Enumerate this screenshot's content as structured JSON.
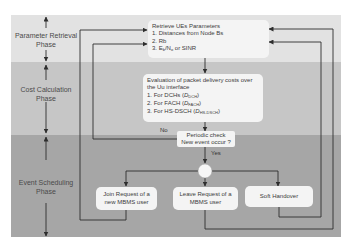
{
  "colors": {
    "band_retrieval": "#e2e2e2",
    "band_cost": "#c6c6c6",
    "band_event": "#a6a6a6",
    "box_fill": "#f4f4f4",
    "line": "#2e2e2e"
  },
  "phases": [
    {
      "label_line1": "Parameter Retrieval",
      "label_line2": "Phase"
    },
    {
      "label_line1": "Cost Calculation",
      "label_line2": "Phase"
    },
    {
      "label_line1": "Event Scheduling",
      "label_line2": "Phase"
    }
  ],
  "boxes": {
    "retrieve": {
      "title": "Retrieve UEs Parameters",
      "items": [
        "1. Distances from Node Bs",
        "2. Rb",
        "3. Eb/No or SINR"
      ],
      "item3_prefix": "3. E",
      "item3_sub1": "b",
      "item3_mid": "/N",
      "item3_sub2": "o",
      "item3_suffix": " or SINR"
    },
    "evaluation": {
      "title_line1": "Evaluation of packet delivery costs over",
      "title_line2": "the Uu interface",
      "items": [
        {
          "prefix": "1. For DCHs (",
          "var": "D",
          "sub": "DCH",
          "suffix": ")"
        },
        {
          "prefix": "2. For FACH (",
          "var": "D",
          "sub": "FACH",
          "suffix": ")"
        },
        {
          "prefix": "3. For HS-DSCH (",
          "var": "D",
          "sub": "HS-DSCH",
          "suffix": ")"
        }
      ]
    },
    "decision": {
      "line1": "Periodic check",
      "line2": "New event occur ?"
    },
    "join": {
      "line1": "Join Request of a",
      "line2": "new MBMS user"
    },
    "leave": {
      "line1": "Leave Request of a",
      "line2": "MBMS user"
    },
    "handover": {
      "label": "Soft Handover"
    }
  },
  "edge_labels": {
    "no": "No",
    "yes": "Yes"
  }
}
